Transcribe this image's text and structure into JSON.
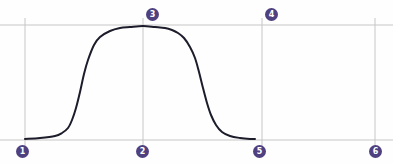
{
  "figure": {
    "title": "",
    "background_color": "#fefefe",
    "width": 393,
    "height": 164
  },
  "style": {
    "grid_color": "#c6c6c6",
    "curve_color": "#1c1c2b",
    "marker_fill": "#4f4080",
    "marker_text_color": "#ffffff",
    "curve_width": 2,
    "grid_width": 1
  },
  "gridlines": {
    "horizontal": [
      {
        "name": "top-gridline",
        "y": 25,
        "x1": 0,
        "x2": 393
      },
      {
        "name": "bottom-gridline",
        "y": 140,
        "x1": 0,
        "x2": 393
      }
    ],
    "vertical": [
      {
        "name": "vline-1",
        "x": 25,
        "y1": 18,
        "y2": 150
      },
      {
        "name": "vline-2",
        "x": 143,
        "y1": 18,
        "y2": 150
      },
      {
        "name": "vline-3",
        "x": 262,
        "y1": 18,
        "y2": 150
      },
      {
        "name": "vline-4",
        "x": 375,
        "y1": 18,
        "y2": 150
      }
    ]
  },
  "markers": [
    {
      "id": "1",
      "label": "1",
      "x": 16,
      "y": 145
    },
    {
      "id": "2",
      "label": "2",
      "x": 136,
      "y": 145
    },
    {
      "id": "3",
      "label": "3",
      "x": 146,
      "y": 8
    },
    {
      "id": "4",
      "label": "4",
      "x": 265,
      "y": 8
    },
    {
      "id": "5",
      "label": "5",
      "x": 253,
      "y": 145
    },
    {
      "id": "6",
      "label": "6",
      "x": 369,
      "y": 145
    }
  ],
  "chart_data": {
    "type": "line",
    "title": "",
    "xlabel": "",
    "ylabel": "",
    "grid": true,
    "legend": null,
    "xlim": [
      0,
      393
    ],
    "ylim": [
      164,
      0
    ],
    "series": [
      {
        "name": "plateau-curve",
        "color": "#1c1c2b",
        "x": [
          25,
          40,
          55,
          62,
          68,
          72,
          76,
          80,
          84,
          88,
          94,
          100,
          110,
          120,
          130,
          143,
          155,
          165,
          172,
          178,
          184,
          190,
          195,
          199,
          203,
          207,
          211,
          216,
          222,
          230,
          240,
          250,
          255
        ],
        "y": [
          139,
          138,
          136,
          133,
          128,
          120,
          108,
          92,
          74,
          60,
          45,
          37,
          31,
          28,
          27,
          26,
          27,
          28,
          30,
          33,
          38,
          47,
          58,
          72,
          88,
          103,
          115,
          125,
          132,
          136,
          138,
          139,
          139
        ]
      }
    ],
    "annotations": [
      {
        "label": "1",
        "x": 22,
        "y": 151,
        "note": "left baseline origin"
      },
      {
        "label": "2",
        "x": 142,
        "y": 151,
        "note": "baseline center"
      },
      {
        "label": "3",
        "x": 152,
        "y": 14,
        "note": "plateau apex"
      },
      {
        "label": "4",
        "x": 271,
        "y": 14,
        "note": "top right intersection"
      },
      {
        "label": "5",
        "x": 259,
        "y": 151,
        "note": "curve returns to baseline"
      },
      {
        "label": "6",
        "x": 375,
        "y": 151,
        "note": "bottom right intersection"
      }
    ]
  }
}
